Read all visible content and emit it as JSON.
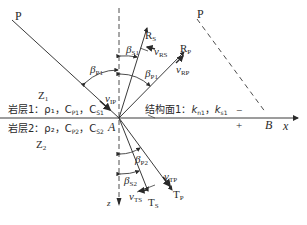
{
  "labels": {
    "p_incident": "P",
    "p_virtual": "P",
    "rs": "R",
    "rs_sub": "S",
    "rp": "R",
    "rp_sub": "P",
    "v_rs": "v",
    "v_rs_sub": "RS",
    "v_rp": "v",
    "v_rp_sub": "RP",
    "v_ip": "v",
    "v_ip_sub": "IP",
    "beta_p1_left": "β",
    "beta_p1_left_sub": "P1",
    "beta_s1": "β",
    "beta_s1_sub": "S1",
    "beta_p1_right": "β",
    "beta_p1_right_sub": "P1",
    "beta_p2": "β",
    "beta_p2_sub": "P2",
    "beta_s2": "β",
    "beta_s2_sub": "S2",
    "z1": "Z",
    "z1_sub": "1",
    "z2": "Z",
    "z2_sub": "2",
    "layer1": "岩层1：ρ₁，C",
    "layer1_cp": "P1",
    "layer1_cs": "S1",
    "layer2": "岩层2：ρ₂，C",
    "layer2_cp": "P2",
    "layer2_cs": "S2",
    "interface": "结构面1：",
    "interface_kn": "k",
    "interface_kn_sub": "n1",
    "interface_ks": "k",
    "interface_ks_sub": "s1",
    "point_a": "A",
    "point_b": "B",
    "minus": "−",
    "plus": "+",
    "x_axis": "x",
    "z_axis": "z",
    "tp": "T",
    "tp_sub": "P",
    "ts": "T",
    "ts_sub": "S",
    "v_tp": "v",
    "v_tp_sub": "TP",
    "v_ts": "v",
    "v_ts_sub": "TS"
  },
  "colors": {
    "line": "#3a3a3a",
    "text": "#2a2a2a",
    "background": "#ffffff"
  }
}
